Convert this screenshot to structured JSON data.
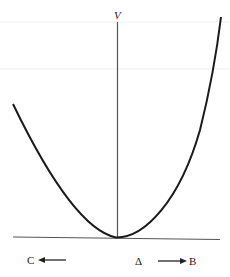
{
  "diagram": {
    "type": "potential-energy-curve",
    "y_axis_label": "V",
    "labels": {
      "left": "C",
      "center": "Δ",
      "right": "B"
    },
    "arrows": {
      "left": "toward C",
      "right": "toward B"
    },
    "colors": {
      "curve": "#1a1a1a",
      "axis": "#555555",
      "guide_lines": "#eeeeee",
      "background": "#ffffff"
    }
  }
}
